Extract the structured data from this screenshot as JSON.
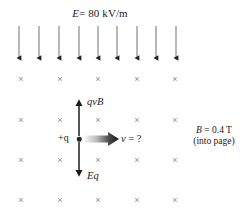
{
  "figure": {
    "width": 247,
    "height": 216,
    "background_color": "#ffffff"
  },
  "labels": {
    "electric_field": "E = 80 kV/m",
    "electric_field_symbol": "E",
    "electric_field_value": "= 80 kV/m",
    "magnetic_field_symbol": "B",
    "magnetic_field_value": "= 0.4 T",
    "magnetic_field_direction": "(into page)",
    "magnetic_force": "qvB",
    "electric_force": "Eq",
    "velocity_unknown": "v = ?",
    "velocity_symbol": "v",
    "velocity_question": "= ?",
    "charge": "+q",
    "cross_glyph": "×"
  },
  "colors": {
    "ink": "#1a1a1a",
    "field_arrow_shaft": "#9a9a9a",
    "field_arrow_head": "#222222",
    "cross_mark": "#8e8e8e",
    "force_arrow": "#1c1c1c",
    "velocity_arrow_dark": "#161616",
    "velocity_arrow_light": "#f2f2f2",
    "charge_dot": "#262626"
  },
  "field_arrows": {
    "count": 9,
    "direction": "down",
    "top_y": 26,
    "bottom_y": 64,
    "x_positions": [
      19,
      39,
      59,
      79,
      98,
      117,
      137,
      156,
      176
    ]
  },
  "cross_grid": {
    "rows": 4,
    "columns": 5,
    "x_positions": [
      21,
      60,
      98,
      137,
      175
    ],
    "y_positions": [
      79,
      120,
      160,
      200
    ],
    "meaning": "magnetic field into page"
  },
  "force_arrows": [
    {
      "name": "magnetic-force-arrow",
      "label": "qvB",
      "direction": "up",
      "x": 79,
      "tail_y": 137,
      "tip_y": 97
    },
    {
      "name": "electric-force-arrow",
      "label": "Eq",
      "direction": "down",
      "x": 79,
      "tail_y": 141,
      "tip_y": 179
    },
    {
      "name": "velocity-arrow",
      "label": "v = ?",
      "direction": "right",
      "y": 139,
      "tail_x": 86,
      "tip_x": 118
    }
  ],
  "charge": {
    "label": "+q",
    "sign": "positive",
    "x": 79,
    "y": 139
  }
}
